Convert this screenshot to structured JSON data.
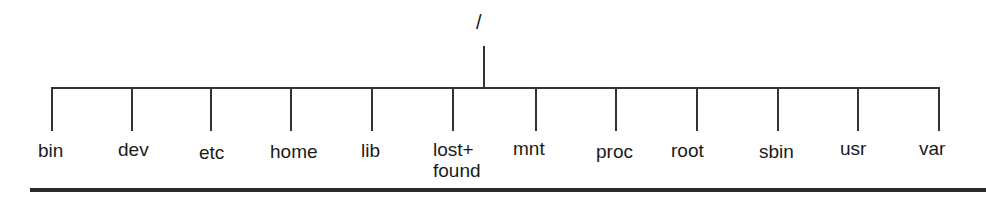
{
  "diagram": {
    "root": {
      "label": "/"
    },
    "children": [
      {
        "label": "bin"
      },
      {
        "label": "dev"
      },
      {
        "label": "etc"
      },
      {
        "label": "home"
      },
      {
        "label": "lib"
      },
      {
        "label_line1": "lost+",
        "label_line2": "found",
        "label": "lost+found"
      },
      {
        "label": "mnt"
      },
      {
        "label": "proc"
      },
      {
        "label": "root"
      },
      {
        "label": "sbin"
      },
      {
        "label": "usr"
      },
      {
        "label": "var"
      }
    ],
    "colors": {
      "line": "#333333",
      "text": "#1a1a1a",
      "background": "#ffffff"
    }
  }
}
